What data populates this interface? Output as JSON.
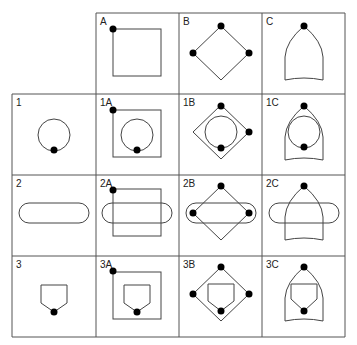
{
  "columns": [
    "A",
    "B",
    "C"
  ],
  "rows": [
    "1",
    "2",
    "3"
  ],
  "cells": {
    "A": "A",
    "B": "B",
    "C": "C",
    "r1": "1",
    "r1A": "1A",
    "r1B": "1B",
    "r1C": "1C",
    "r2": "2",
    "r2A": "2A",
    "r2B": "2B",
    "r2C": "2C",
    "r3": "3",
    "r3A": "3A",
    "r3B": "3B",
    "r3C": "3C"
  },
  "shapes": {
    "A": "square",
    "B": "diamond",
    "C": "bullet-arch",
    "1": "circle",
    "2": "stadium",
    "3": "pentagon-shield"
  },
  "colors": {
    "line": "#444444",
    "dot": "#000000",
    "grid": "#555555"
  }
}
